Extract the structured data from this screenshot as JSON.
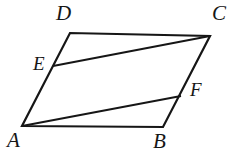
{
  "figure": {
    "kind": "geometry-diagram",
    "shape": "parallelogram-with-two-cevians",
    "width": 233,
    "height": 152,
    "background_color": "#ffffff",
    "stroke_color": "#161616",
    "label_color": "#161616",
    "stroke_width": 2.2,
    "thin_stroke_width": 1.9
  },
  "points": {
    "A": {
      "label": "A",
      "x": 22,
      "y": 126,
      "label_x": 7,
      "label_y": 130,
      "label_size": "lbl-big"
    },
    "B": {
      "label": "B",
      "x": 163,
      "y": 127,
      "label_x": 153,
      "label_y": 131,
      "label_size": "lbl-big"
    },
    "C": {
      "label": "C",
      "x": 210,
      "y": 36,
      "label_x": 212,
      "label_y": 3,
      "label_size": "lbl-big"
    },
    "D": {
      "label": "D",
      "x": 70,
      "y": 33,
      "label_x": 56,
      "label_y": 3,
      "label_size": "lbl-big"
    },
    "E": {
      "label": "E",
      "x": 53,
      "y": 66,
      "label_x": 33,
      "label_y": 54,
      "label_size": "lbl-mid"
    },
    "F": {
      "label": "F",
      "x": 181,
      "y": 96,
      "label_x": 190,
      "label_y": 80,
      "label_size": "lbl-mid"
    }
  },
  "segments": [
    {
      "name": "side-AB",
      "from": "A",
      "to": "B",
      "weight": "thick"
    },
    {
      "name": "side-BC",
      "from": "B",
      "to": "C",
      "weight": "thick"
    },
    {
      "name": "side-CD",
      "from": "C",
      "to": "D",
      "weight": "thick"
    },
    {
      "name": "side-DA",
      "from": "D",
      "to": "A",
      "weight": "thick"
    },
    {
      "name": "cevian-EC",
      "from": "E",
      "to": "C",
      "weight": "thin"
    },
    {
      "name": "cevian-AF",
      "from": "A",
      "to": "F",
      "weight": "thin"
    }
  ],
  "path_data": {
    "outline": "M 22 126 L 163 127 L 210 36 L 70 33 Z",
    "cevian_ec": "M 53 66 L 210 36",
    "cevian_af": "M 22 126 L 181 96"
  }
}
